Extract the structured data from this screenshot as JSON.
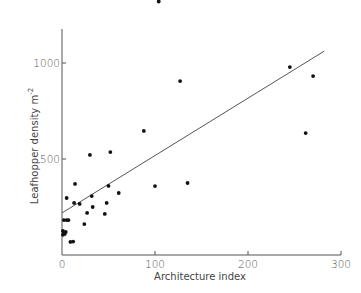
{
  "chart_data": {
    "type": "scatter",
    "title": "",
    "xlabel": "Architecture index",
    "ylabel": "Leafhopper density m",
    "ylabel_superscript": "-2",
    "xlim": [
      0,
      300
    ],
    "ylim": [
      0,
      1200
    ],
    "xticks": [
      0,
      100,
      200,
      300
    ],
    "yticks": [
      0,
      500,
      1000
    ],
    "xtick_labels": [
      "0",
      "100",
      "200",
      "300"
    ],
    "ytick_labels": [
      "0",
      "500",
      "1000"
    ],
    "grid": false,
    "legend": null,
    "series": [
      {
        "name": "observations",
        "points": [
          [
            104,
            1320
          ],
          [
            127,
            906
          ],
          [
            245,
            979
          ],
          [
            270,
            932
          ],
          [
            262,
            635
          ],
          [
            88,
            646
          ],
          [
            30,
            521
          ],
          [
            52,
            536
          ],
          [
            100,
            359
          ],
          [
            135,
            375
          ],
          [
            14,
            370
          ],
          [
            5,
            297
          ],
          [
            50,
            360
          ],
          [
            13,
            271
          ],
          [
            19,
            266
          ],
          [
            32,
            307
          ],
          [
            33,
            250
          ],
          [
            27,
            219
          ],
          [
            48,
            271
          ],
          [
            46,
            214
          ],
          [
            61,
            323
          ],
          [
            24,
            161
          ],
          [
            2,
            182
          ],
          [
            5,
            182
          ],
          [
            7,
            182
          ],
          [
            1,
            125
          ],
          [
            2,
            115
          ],
          [
            3,
            110
          ],
          [
            4,
            120
          ],
          [
            1,
            105
          ],
          [
            9,
            68
          ],
          [
            12,
            70
          ]
        ]
      },
      {
        "name": "regression line",
        "type": "line",
        "points": [
          [
            0,
            219
          ],
          [
            282,
            1062
          ]
        ]
      }
    ]
  }
}
